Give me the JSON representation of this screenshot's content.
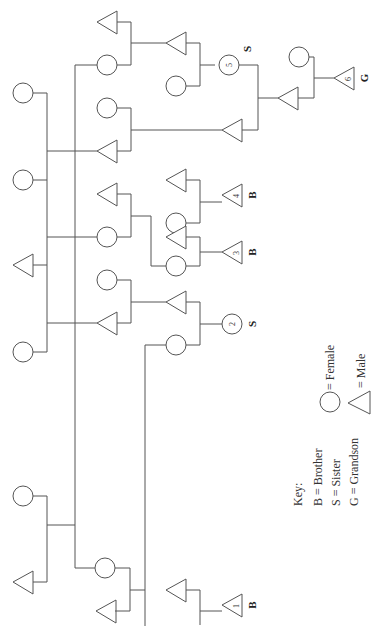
{
  "diagram": {
    "type": "pedigree",
    "orientation": "rotated-90-ccw",
    "line_color": "#555555",
    "labels": {
      "p1_number": "1",
      "p1_tag": "B",
      "p2_number": "2",
      "p2_tag": "S",
      "p3_number": "3",
      "p3_tag": "B",
      "p4_number": "4",
      "p4_tag": "B",
      "p5_number": "5",
      "p5_tag": "S",
      "p6_number": "6",
      "p6_tag": "G"
    },
    "key": {
      "title": "Key:",
      "entries": [
        "B = Brother",
        "S = Sister",
        "G = Grandson"
      ],
      "female_label": "= Female",
      "male_label": "= Male"
    }
  }
}
